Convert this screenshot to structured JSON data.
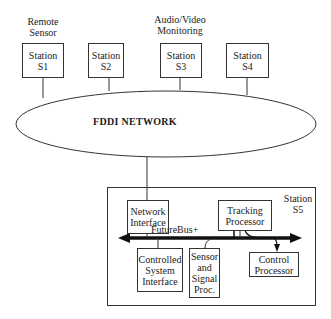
{
  "network": {
    "label": "FDDI NETWORK"
  },
  "stations": [
    {
      "id": "S1",
      "line1": "Station",
      "line2": "S1",
      "caption_line1": "Remote",
      "caption_line2": "Sensor"
    },
    {
      "id": "S2",
      "line1": "Station",
      "line2": "S2"
    },
    {
      "id": "S3",
      "line1": "Station",
      "line2": "S3",
      "caption_line1": "Audio/Video",
      "caption_line2": "Monitoring"
    },
    {
      "id": "S4",
      "line1": "Station",
      "line2": "S4"
    }
  ],
  "station5": {
    "title_line1": "Station",
    "title_line2": "S5",
    "bus_label": "FutureBus+",
    "network_interface": {
      "line1": "Network",
      "line2": "Interface"
    },
    "tracking_processor": {
      "line1": "Tracking",
      "line2": "Processor"
    },
    "controlled_system_interface": {
      "line1": "Controlled",
      "line2": "System",
      "line3": "Interface"
    },
    "sensor_signal_proc": {
      "line1": "Sensor",
      "line2": "and",
      "line3": "Signal",
      "line4": "Proc."
    },
    "control_processor": {
      "line1": "Control",
      "line2": "Processor"
    }
  }
}
